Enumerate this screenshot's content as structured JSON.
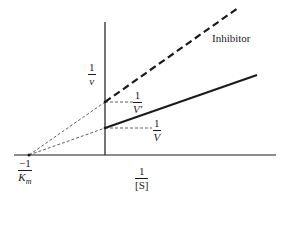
{
  "diagram": {
    "type": "double-reciprocal plot",
    "colors": {
      "ink": "#1a1a1a",
      "background": "#ffffff"
    },
    "y_axis_label": {
      "num": "1",
      "den": "v"
    },
    "x_axis_label": {
      "num": "1",
      "den": "[S]"
    },
    "x_intercept_label": {
      "num": "−1",
      "den": "Km"
    },
    "intercept_no_inhibitor": {
      "num": "1",
      "den": "V"
    },
    "intercept_inhibitor": {
      "num": "1",
      "den": "V′"
    },
    "inhibitor_label": "Inhibitor",
    "lines": [
      {
        "name": "no-inhibitor",
        "style": "solid",
        "x_intercept": -1,
        "y_intercept": 1,
        "slope": 1
      },
      {
        "name": "with-inhibitor",
        "style": "dashed",
        "x_intercept": -1,
        "y_intercept": 2,
        "slope": 2
      }
    ]
  }
}
